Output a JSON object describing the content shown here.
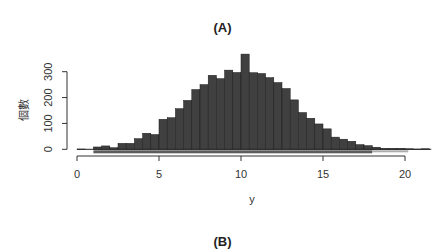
{
  "chart_data": {
    "type": "bar",
    "subtype": "histogram",
    "title": "(A)",
    "next_panel_title_partial": "(B)",
    "xlabel": "y",
    "ylabel": "個數",
    "bin_width": 0.5,
    "bin_starts": [
      0,
      0.5,
      1,
      1.5,
      2,
      2.5,
      3,
      3.5,
      4,
      4.5,
      5,
      5.5,
      6,
      6.5,
      7,
      7.5,
      8,
      8.5,
      9,
      9.5,
      10,
      10.5,
      11,
      11.5,
      12,
      12.5,
      13,
      13.5,
      14,
      14.5,
      15,
      15.5,
      16,
      16.5,
      17,
      17.5,
      18,
      18.5,
      19,
      19.5,
      20,
      20.5,
      21
    ],
    "values": [
      1,
      0,
      9,
      13,
      6,
      23,
      23,
      41,
      62,
      57,
      116,
      122,
      157,
      189,
      231,
      250,
      286,
      273,
      306,
      297,
      368,
      296,
      293,
      277,
      258,
      235,
      191,
      142,
      120,
      98,
      79,
      47,
      39,
      31,
      18,
      14,
      8,
      4,
      4,
      4,
      2,
      1,
      2
    ],
    "x_ticks": [
      "0",
      "5",
      "10",
      "15",
      "20"
    ],
    "y_ticks": [
      "0",
      "100",
      "200",
      "300"
    ],
    "xlim": [
      0,
      21.5
    ],
    "ylim": [
      0,
      370
    ],
    "grid": false,
    "legend": null,
    "rug": true,
    "bar_color": "#404040"
  }
}
